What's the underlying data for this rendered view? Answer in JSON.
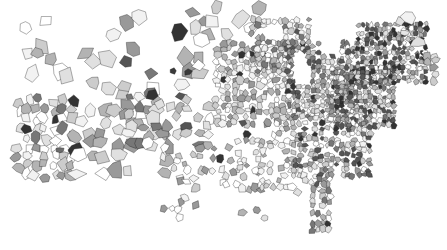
{
  "figure": {
    "title": "",
    "caption": "",
    "background_color": "#ffffff",
    "width_px": 447,
    "height_px": 250,
    "has_legend": false,
    "has_axes": false,
    "has_frame": false,
    "has_text_labels": false
  },
  "chart_data": {
    "type": "heatmap",
    "subtype": "choropleth-map",
    "title": "",
    "subtitle": "",
    "xlabel": "",
    "ylabel": "",
    "region": "United States (contiguous 48 states)",
    "unit_geography": "county",
    "projection": "Albers equal-area conic",
    "grid": false,
    "legend_position": "none",
    "annotations": [],
    "color_scale": {
      "type": "sequential-gray",
      "outline_color": "#1a1a1a",
      "outline_width_px": 0.35,
      "no_data_color": "#ffffff",
      "levels": [
        {
          "label": "no data",
          "color": "#ffffff",
          "value": null
        },
        {
          "label": "very low",
          "color": "#f2f2f2",
          "value": 1
        },
        {
          "label": "low",
          "color": "#e0e0e0",
          "value": 2
        },
        {
          "label": "low-mid",
          "color": "#cccccc",
          "value": 3
        },
        {
          "label": "mid",
          "color": "#b3b3b3",
          "value": 4
        },
        {
          "label": "mid-high",
          "color": "#999999",
          "value": 5
        },
        {
          "label": "high",
          "color": "#777777",
          "value": 6
        },
        {
          "label": "very high",
          "color": "#555555",
          "value": 7
        },
        {
          "label": "maximum",
          "color": "#333333",
          "value": 8
        }
      ]
    },
    "observed_density": {
      "west_large_sparse_counties": "large polygons, light-to-mid gray, many white",
      "midwest_plains": "dense small square counties, mixed light and mid gray",
      "great_lakes": "dense cluster, white gap for Lake Michigan",
      "northeast": "densest cluster, darkest overall shading",
      "florida_peninsula": "narrow vertical chain of small counties, mid gray",
      "texas_south": "scattered small counties, many white"
    },
    "notable_features": [
      {
        "name": "dark-county-pair-nevada-utah",
        "approx_xy": [
          173,
          71
        ],
        "color": "#3a3a3a"
      },
      {
        "name": "dark-county-pair-second",
        "approx_xy": [
          188,
          72
        ],
        "color": "#3a3a3a"
      },
      {
        "name": "maine-light-block",
        "approx_xy": [
          405,
          33
        ],
        "color": "#e6e6e6"
      },
      {
        "name": "california-coastal-dark",
        "approx_xy": [
          60,
          150
        ],
        "color": "#6b6b6b"
      },
      {
        "name": "lake-michigan-void",
        "approx_xy": [
          300,
          70
        ],
        "color": "#ffffff"
      }
    ]
  }
}
